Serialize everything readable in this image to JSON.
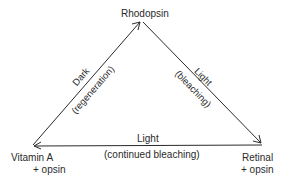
{
  "diagram": {
    "nodes": {
      "top": "Rhodopsin",
      "left_line1": "Vitamin A",
      "left_line2": "+ opsin",
      "right_line1": "Retinal",
      "right_line2": "+ opsin"
    },
    "edges": {
      "left": {
        "line1": "Dark",
        "line2": "(regeneration)",
        "direction": "Vitamin A + opsin -> Rhodopsin"
      },
      "right": {
        "line1": "Light",
        "line2": "(bleaching)",
        "direction": "Rhodopsin -> Retinal + opsin"
      },
      "bottom": {
        "line1": "Light",
        "line2": "(continued bleaching)",
        "direction": "Retinal + opsin -> Vitamin A + opsin"
      }
    },
    "colors": {
      "line": "#2a2a2a",
      "text": "#2a2a2a",
      "background": "#ffffff"
    }
  }
}
